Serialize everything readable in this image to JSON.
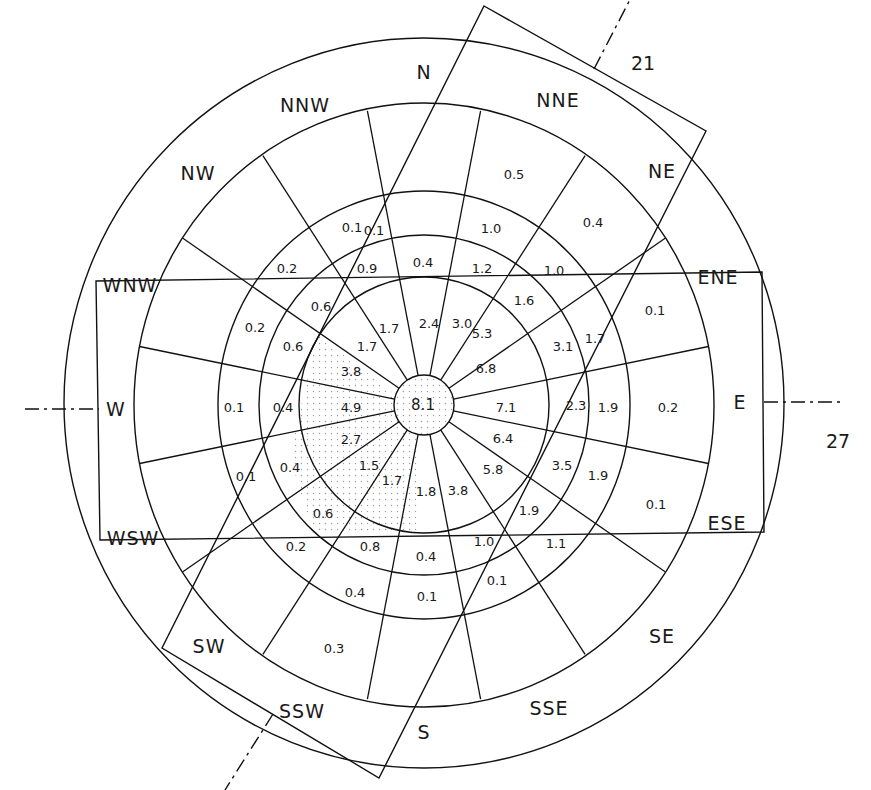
{
  "diagram": {
    "title": "",
    "center_value": {
      "label": "8.1",
      "x": 423,
      "y": 405
    },
    "direction_labels": [
      {
        "label": "N",
        "x": 424,
        "y": 72
      },
      {
        "label": "NNE",
        "x": 558,
        "y": 100
      },
      {
        "label": "NE",
        "x": 662,
        "y": 171
      },
      {
        "label": "ENE",
        "x": 718,
        "y": 277
      },
      {
        "label": "E",
        "x": 740,
        "y": 402
      },
      {
        "label": "ESE",
        "x": 727,
        "y": 523
      },
      {
        "label": "SE",
        "x": 662,
        "y": 636
      },
      {
        "label": "SSE",
        "x": 549,
        "y": 708
      },
      {
        "label": "S",
        "x": 424,
        "y": 732
      },
      {
        "label": "SSW",
        "x": 302,
        "y": 711
      },
      {
        "label": "SW",
        "x": 209,
        "y": 646
      },
      {
        "label": "WSW",
        "x": 133,
        "y": 538
      },
      {
        "label": "W",
        "x": 116,
        "y": 409
      },
      {
        "label": "WNW",
        "x": 130,
        "y": 285
      },
      {
        "label": "NW",
        "x": 198,
        "y": 173
      },
      {
        "label": "NNW",
        "x": 305,
        "y": 105
      }
    ],
    "runway_labels": [
      {
        "label": "21",
        "x": 643,
        "y": 63
      },
      {
        "label": "27",
        "x": 838,
        "y": 441
      }
    ],
    "cell_values": [
      {
        "label": "0.5",
        "x": 514,
        "y": 174
      },
      {
        "label": "0.4",
        "x": 593,
        "y": 222
      },
      {
        "label": "0.1",
        "x": 374,
        "y": 230
      },
      {
        "label": "0.1",
        "x": 352,
        "y": 227
      },
      {
        "label": "1.0",
        "x": 491,
        "y": 228
      },
      {
        "label": "0.2",
        "x": 287,
        "y": 268
      },
      {
        "label": "0.9",
        "x": 367,
        "y": 268
      },
      {
        "label": "0.4",
        "x": 423,
        "y": 262
      },
      {
        "label": "1.2",
        "x": 482,
        "y": 268
      },
      {
        "label": "1.0",
        "x": 554,
        "y": 270
      },
      {
        "label": "0.6",
        "x": 321,
        "y": 306
      },
      {
        "label": "1.6",
        "x": 524,
        "y": 300
      },
      {
        "label": "0.1",
        "x": 655,
        "y": 310
      },
      {
        "label": "0.2",
        "x": 255,
        "y": 327
      },
      {
        "label": "1.7",
        "x": 389,
        "y": 328
      },
      {
        "label": "2.4",
        "x": 429,
        "y": 323
      },
      {
        "label": "3.0",
        "x": 462,
        "y": 323
      },
      {
        "label": "5.3",
        "x": 482,
        "y": 333
      },
      {
        "label": "3.1",
        "x": 563,
        "y": 346
      },
      {
        "label": "1.7",
        "x": 595,
        "y": 338
      },
      {
        "label": "0.6",
        "x": 293,
        "y": 346
      },
      {
        "label": "1.7",
        "x": 367,
        "y": 346
      },
      {
        "label": "3.8",
        "x": 351,
        "y": 371
      },
      {
        "label": "6.8",
        "x": 486,
        "y": 368
      },
      {
        "label": "0.1",
        "x": 234,
        "y": 407
      },
      {
        "label": "0.4",
        "x": 283,
        "y": 407
      },
      {
        "label": "4.9",
        "x": 351,
        "y": 407
      },
      {
        "label": "7.1",
        "x": 506,
        "y": 407
      },
      {
        "label": "2.3",
        "x": 576,
        "y": 405
      },
      {
        "label": "1.9",
        "x": 608,
        "y": 407
      },
      {
        "label": "0.2",
        "x": 668,
        "y": 407
      },
      {
        "label": "2.7",
        "x": 351,
        "y": 439
      },
      {
        "label": "6.4",
        "x": 503,
        "y": 438
      },
      {
        "label": "0.1",
        "x": 246,
        "y": 476
      },
      {
        "label": "0.4",
        "x": 290,
        "y": 467
      },
      {
        "label": "1.5",
        "x": 369,
        "y": 465
      },
      {
        "label": "5.8",
        "x": 493,
        "y": 469
      },
      {
        "label": "3.5",
        "x": 562,
        "y": 465
      },
      {
        "label": "1.9",
        "x": 598,
        "y": 475
      },
      {
        "label": "1.7",
        "x": 392,
        "y": 480
      },
      {
        "label": "1.8",
        "x": 426,
        "y": 491
      },
      {
        "label": "3.8",
        "x": 458,
        "y": 490
      },
      {
        "label": "1.9",
        "x": 529,
        "y": 510
      },
      {
        "label": "0.1",
        "x": 656,
        "y": 504
      },
      {
        "label": "0.6",
        "x": 323,
        "y": 513
      },
      {
        "label": "0.2",
        "x": 296,
        "y": 546
      },
      {
        "label": "0.8",
        "x": 370,
        "y": 546
      },
      {
        "label": "0.4",
        "x": 426,
        "y": 556
      },
      {
        "label": "1.0",
        "x": 484,
        "y": 541
      },
      {
        "label": "1.1",
        "x": 556,
        "y": 543
      },
      {
        "label": "0.4",
        "x": 355,
        "y": 592
      },
      {
        "label": "0.1",
        "x": 427,
        "y": 596
      },
      {
        "label": "0.1",
        "x": 497,
        "y": 580
      },
      {
        "label": "0.3",
        "x": 334,
        "y": 648
      }
    ]
  }
}
